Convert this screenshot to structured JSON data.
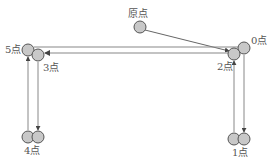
{
  "diagram": {
    "title": "",
    "colors": {
      "node_fill": "#c8c8c8",
      "node_stroke": "#555555",
      "line": "#666666",
      "label": "#555555"
    },
    "nodes": [
      {
        "id": "origin",
        "label": "原点",
        "cx": 140,
        "cy": 27
      },
      {
        "id": "n0",
        "label": "0点",
        "cx": 244,
        "cy": 48
      },
      {
        "id": "n2",
        "label": "2点",
        "cx": 234,
        "cy": 54
      },
      {
        "id": "n5",
        "label": "5点",
        "cx": 28,
        "cy": 50
      },
      {
        "id": "n3",
        "label": "3点",
        "cx": 38,
        "cy": 55
      },
      {
        "id": "n4a",
        "label": "4点",
        "cx": 28,
        "cy": 137
      },
      {
        "id": "n4b",
        "label": "",
        "cx": 38,
        "cy": 137
      },
      {
        "id": "n1a",
        "label": "1点",
        "cx": 234,
        "cy": 139
      },
      {
        "id": "n1b",
        "label": "",
        "cx": 244,
        "cy": 139
      }
    ],
    "labels": {
      "origin": "原点",
      "p0": "0点",
      "p1": "1点",
      "p2": "2点",
      "p3": "3点",
      "p4": "4点",
      "p5": "5点"
    },
    "edges": [
      {
        "from": "origin",
        "to": "n2",
        "arrow": "end"
      },
      {
        "from": "n0",
        "to": "n5",
        "arrow": "none"
      },
      {
        "from": "n2",
        "to": "n3",
        "arrow": "end"
      },
      {
        "from": "n0",
        "to": "n1b",
        "arrow": "end"
      },
      {
        "from": "n1a",
        "to": "n2",
        "arrow": "end"
      },
      {
        "from": "n3",
        "to": "n4b",
        "arrow": "end"
      },
      {
        "from": "n4a",
        "to": "n5",
        "arrow": "end"
      }
    ]
  }
}
